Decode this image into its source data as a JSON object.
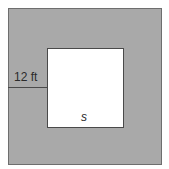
{
  "diagram": {
    "outer_square": {
      "fill": "#a9a9a9",
      "border": "#6e6e6e"
    },
    "inner_square": {
      "fill": "#ffffff",
      "border": "#4a4a4a",
      "side_label": "s"
    },
    "border_width_label": "12 ft"
  }
}
